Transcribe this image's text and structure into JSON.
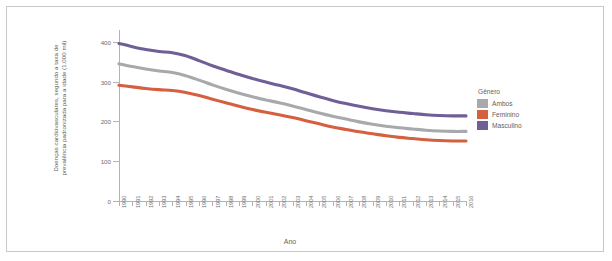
{
  "figure": {
    "y_axis_title_line1": "Doenças cardiovasculares, segundo a taxa de",
    "y_axis_title_line2": "prevalência padronizada para a idade (1.000 mil)",
    "x_axis_title": "Ano"
  },
  "legend": {
    "title": "Gênero",
    "items": [
      {
        "label": "Ambos",
        "color": "#a7a9ac"
      },
      {
        "label": "Feminino",
        "color": "#d4603f"
      },
      {
        "label": "Masculino",
        "color": "#6f5f96"
      }
    ]
  },
  "chart_data": {
    "type": "line",
    "title": "",
    "xlabel": "Ano",
    "ylabel": "Doenças cardiovasculares, segundo a taxa de prevalência padronizada para a idade (1.000 mil)",
    "xlim": [
      1990,
      2016
    ],
    "ylim": [
      0,
      430
    ],
    "yticks": [
      0,
      100,
      200,
      300,
      400
    ],
    "ytick_labels": [
      "0",
      "100",
      "200",
      "300",
      "400"
    ],
    "grid": false,
    "legend_position": "right",
    "x": [
      1990,
      1991,
      1992,
      1993,
      1994,
      1995,
      1996,
      1997,
      1998,
      1999,
      2000,
      2001,
      2002,
      2003,
      2004,
      2005,
      2006,
      2007,
      2008,
      2009,
      2010,
      2011,
      2012,
      2013,
      2014,
      2015,
      2016
    ],
    "xtick_labels": [
      "1990",
      "1991",
      "1992",
      "1993",
      "1994",
      "1995",
      "1996",
      "1997",
      "1998",
      "1999",
      "2000",
      "2001",
      "2002",
      "2003",
      "2004",
      "2005",
      "2006",
      "2007",
      "2008",
      "2009",
      "2010",
      "2011",
      "2012",
      "2013",
      "2014",
      "2015",
      "2016"
    ],
    "series": [
      {
        "name": "Masculino",
        "color": "#6f5f96",
        "values": [
          396,
          388,
          381,
          376,
          373,
          365,
          353,
          340,
          329,
          318,
          308,
          299,
          291,
          282,
          272,
          262,
          253,
          245,
          238,
          232,
          227,
          223,
          220,
          217,
          215,
          214,
          214
        ]
      },
      {
        "name": "Ambos",
        "color": "#a7a9ac",
        "values": [
          345,
          338,
          332,
          327,
          323,
          315,
          304,
          292,
          281,
          271,
          262,
          254,
          247,
          239,
          230,
          221,
          213,
          206,
          199,
          193,
          188,
          184,
          181,
          178,
          176,
          175,
          175
        ]
      },
      {
        "name": "Feminino",
        "color": "#d4603f",
        "values": [
          291,
          287,
          283,
          280,
          278,
          273,
          265,
          256,
          247,
          238,
          230,
          223,
          217,
          210,
          202,
          194,
          186,
          180,
          174,
          169,
          164,
          160,
          157,
          154,
          152,
          151,
          151
        ]
      }
    ]
  }
}
